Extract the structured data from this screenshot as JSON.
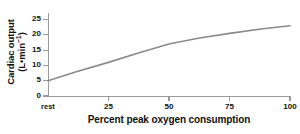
{
  "chart_data": {
    "type": "line",
    "title": "",
    "subtitle": "",
    "xlabel": "Percent peak oxygen consumption",
    "ylabel_line1": "Cardiac output",
    "ylabel_line2": "(L•min",
    "ylabel_exponent": "−1",
    "ylabel_line2_close": ")",
    "ylabel_full": "Cardiac output (L•min⁻¹)",
    "x": [
      0,
      25,
      50,
      75,
      100
    ],
    "xtick_labels": [
      "rest",
      "25",
      "50",
      "75",
      "100"
    ],
    "ytick_labels": [
      "0",
      "5",
      "10",
      "15",
      "20",
      "25"
    ],
    "ytick_values": [
      0,
      5,
      10,
      15,
      20,
      25
    ],
    "xlim": [
      0,
      100
    ],
    "ylim": [
      0,
      27
    ],
    "grid": false,
    "legend": "none",
    "series": [
      {
        "name": "Cardiac output",
        "color": "#8a8a8a",
        "line_width": 1.6,
        "values": [
          5.0,
          11.0,
          17.0,
          20.5,
          23.0
        ],
        "points": [
          {
            "x": 0,
            "y": 5.0
          },
          {
            "x": 12,
            "y": 8.0
          },
          {
            "x": 25,
            "y": 11.0
          },
          {
            "x": 38,
            "y": 14.2
          },
          {
            "x": 50,
            "y": 17.0
          },
          {
            "x": 62,
            "y": 18.9
          },
          {
            "x": 75,
            "y": 20.5
          },
          {
            "x": 88,
            "y": 21.9
          },
          {
            "x": 100,
            "y": 23.0
          }
        ]
      }
    ],
    "axis_color": "#9a9a9a",
    "text_color": "#111111",
    "background": "#ffffff"
  }
}
